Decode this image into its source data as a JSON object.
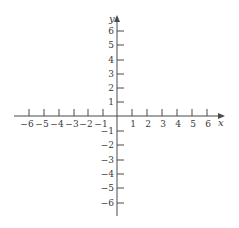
{
  "diagram": {
    "type": "cartesian-coordinate-plane",
    "x_axis": {
      "label": "x",
      "min": -6,
      "max": 6,
      "ticks": [
        -6,
        -5,
        -4,
        -3,
        -2,
        -1,
        1,
        2,
        3,
        4,
        5,
        6
      ]
    },
    "y_axis": {
      "label": "y",
      "min": -6,
      "max": 6,
      "ticks": [
        6,
        5,
        4,
        3,
        2,
        1,
        -1,
        -2,
        -3,
        -4,
        -5,
        -6
      ]
    },
    "colors": {
      "axis": "#4a4a4a",
      "text": "#3a3a3a",
      "background": "#ffffff"
    }
  },
  "labels": {
    "x_axis_label": "x",
    "y_axis_label": "y",
    "x_ticks": [
      "−6",
      "−5",
      "−4",
      "−3",
      "−2",
      "−1",
      "1",
      "2",
      "3",
      "4",
      "5",
      "6"
    ],
    "y_ticks_pos": [
      "6",
      "5",
      "4",
      "3",
      "2",
      "1"
    ],
    "y_ticks_neg": [
      "−1",
      "−2",
      "−3",
      "−4",
      "−5",
      "−6"
    ]
  }
}
